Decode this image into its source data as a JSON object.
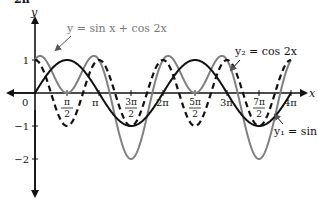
{
  "chart_data": {
    "type": "line",
    "title": "",
    "corner_label": "2π",
    "xlabel": "x",
    "ylabel": "y",
    "xlim": [
      0,
      12.566
    ],
    "ylim": [
      -3,
      2
    ],
    "grid": false,
    "x_ticks": [
      {
        "value": 1.5708,
        "num": "π",
        "den": "2"
      },
      {
        "value": 3.1416,
        "label": "π"
      },
      {
        "value": 4.7124,
        "num": "3π",
        "den": "2"
      },
      {
        "value": 6.2832,
        "label": "2π"
      },
      {
        "value": 7.854,
        "num": "5π",
        "den": "2"
      },
      {
        "value": 9.4248,
        "label": "3π"
      },
      {
        "value": 10.9956,
        "num": "7π",
        "den": "2"
      },
      {
        "value": 12.5664,
        "label": "4π"
      }
    ],
    "y_ticks": [
      {
        "value": 1,
        "label": "1"
      },
      {
        "value": -1,
        "label": "−1"
      },
      {
        "value": -2,
        "label": "−2"
      }
    ],
    "origin_label": "0",
    "series": [
      {
        "name": "y₁ = sin x",
        "formula": "sin(x)",
        "style": "solid",
        "color": "#111111"
      },
      {
        "name": "y₂ = cos 2x",
        "formula": "cos(2x)",
        "style": "dashed",
        "color": "#111111"
      },
      {
        "name": "y = sin x + cos 2x",
        "formula": "sin(x)+cos(2x)",
        "style": "solid",
        "color": "#808080"
      }
    ],
    "annotations": [
      {
        "text": "y = sin x + cos 2x",
        "target_series": 2
      },
      {
        "text": "y₂ = cos 2x",
        "target_series": 1
      },
      {
        "text": "y₁ = sin x",
        "target_series": 0
      }
    ]
  }
}
